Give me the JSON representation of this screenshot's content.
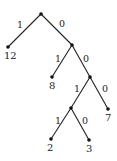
{
  "diagram": {
    "type": "binary-tree",
    "nodes": [
      {
        "id": "root",
        "x": 41,
        "y": 14,
        "label": ""
      },
      {
        "id": "leaf-12",
        "x": 8,
        "y": 47,
        "label": "12"
      },
      {
        "id": "n1",
        "x": 72,
        "y": 45,
        "label": ""
      },
      {
        "id": "leaf-8",
        "x": 52,
        "y": 77,
        "label": "8"
      },
      {
        "id": "n2",
        "x": 90,
        "y": 77,
        "label": ""
      },
      {
        "id": "n3",
        "x": 71,
        "y": 108,
        "label": ""
      },
      {
        "id": "leaf-7",
        "x": 108,
        "y": 109,
        "label": "7"
      },
      {
        "id": "leaf-2",
        "x": 51,
        "y": 139,
        "label": "2"
      },
      {
        "id": "leaf-3",
        "x": 89,
        "y": 140,
        "label": "3"
      }
    ],
    "edges": [
      {
        "from": "root",
        "to": "leaf-12",
        "label": "1"
      },
      {
        "from": "root",
        "to": "n1",
        "label": "0"
      },
      {
        "from": "n1",
        "to": "leaf-8",
        "label": "1"
      },
      {
        "from": "n1",
        "to": "n2",
        "label": "0"
      },
      {
        "from": "n2",
        "to": "n3",
        "label": "1"
      },
      {
        "from": "n2",
        "to": "leaf-7",
        "label": "0"
      },
      {
        "from": "n3",
        "to": "leaf-2",
        "label": "1"
      },
      {
        "from": "n3",
        "to": "leaf-3",
        "label": "0"
      }
    ],
    "leaf_labels": {
      "leaf_12": "12",
      "leaf_8": "8",
      "leaf_7": "7",
      "leaf_2": "2",
      "leaf_3": "3"
    },
    "edge_labels": {
      "root_left": "1",
      "root_right": "0",
      "n1_left": "1",
      "n1_right": "0",
      "n2_left": "1",
      "n2_right": "0",
      "n3_left": "1",
      "n3_right": "0"
    }
  }
}
